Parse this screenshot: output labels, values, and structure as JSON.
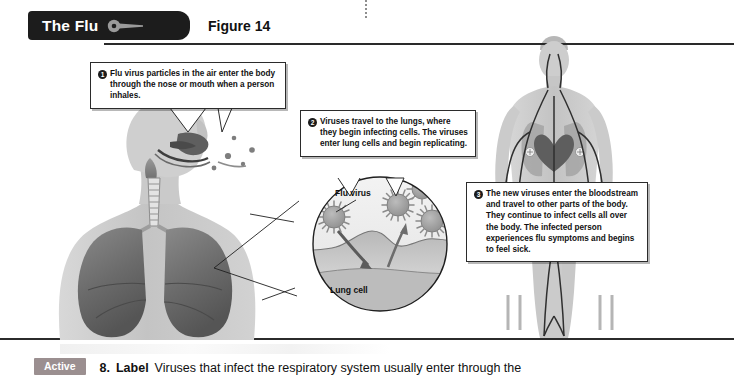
{
  "header": {
    "tab_title": "The Flu",
    "tab_icon": "key-icon",
    "figure_label": "Figure 14"
  },
  "callouts": [
    {
      "number": "1",
      "text": "Flu virus particles in the air enter the body through the nose or mouth when a person inhales."
    },
    {
      "number": "2",
      "text": "Viruses travel to the lungs, where they begin infecting cells. The viruses enter lung cells and begin replicating."
    },
    {
      "number": "3",
      "text": "The new viruses enter the bloodstream and travel to other parts of the body. They continue to infect cells all over the body. The infected person experiences flu symptoms and begins to feel sick."
    }
  ],
  "inset": {
    "flu_virus_label": "Flu virus",
    "lung_cell_label": "Lung cell"
  },
  "question": {
    "badge": "Active",
    "number": "8.",
    "verb": "Label",
    "text": "Viruses that infect the respiratory system usually enter through the"
  },
  "colors": {
    "tab_background": "#1c1c1c",
    "tab_text": "#ffffff",
    "rule": "#2b2b2b",
    "badge_background": "#9b8f90",
    "callout_border": "#2b2b2b",
    "skin": "#c9c9c9",
    "lung": "#6f6f6f",
    "vessel": "#3a3a3a"
  }
}
